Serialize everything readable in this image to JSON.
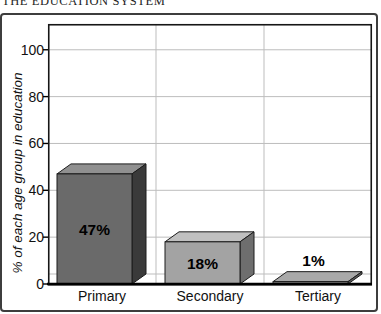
{
  "heading": "THE EDUCATION SYSTEM",
  "chart_data": {
    "type": "bar",
    "projection": "3d",
    "title": "",
    "categories": [
      "Primary",
      "Secondary",
      "Tertiary"
    ],
    "values": [
      47,
      18,
      1
    ],
    "data_labels": [
      "47%",
      "18%",
      "1%"
    ],
    "label_placement": [
      "inside",
      "inside",
      "above"
    ],
    "xlabel": "",
    "ylabel": "% of each age group in education",
    "yticks": [
      0,
      20,
      40,
      60,
      80,
      100
    ],
    "ylim": [
      0,
      111
    ],
    "grid": true,
    "legend": false,
    "colors": {
      "frame": "#3d3d3d",
      "plot_border": "#161616",
      "axis": "#000000",
      "gridline": "#bdbdbd",
      "background": "#ffffff",
      "text": "#111111",
      "outline": "#1c1c1c",
      "bars": [
        {
          "front": "#6a6a6a",
          "top": "#909090",
          "side": "#3a3a3a"
        },
        {
          "front": "#a3a3a3",
          "top": "#c0c0c0",
          "side": "#6e6e6e"
        },
        {
          "front": "#8f8f8f",
          "top": "#a9a9a9",
          "side": "#5a5a5a"
        }
      ]
    }
  }
}
